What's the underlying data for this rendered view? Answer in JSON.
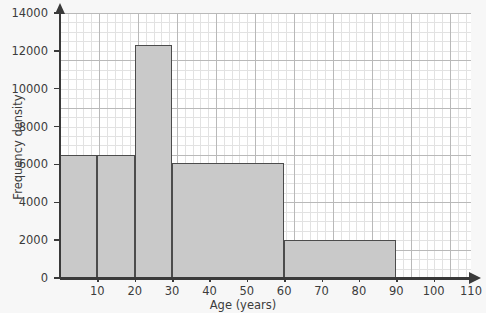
{
  "chart_data": {
    "type": "bar",
    "title": "",
    "subtitle": "",
    "xlabel": "Age (years)",
    "ylabel": "Frequency density",
    "xlim": [
      0,
      110
    ],
    "ylim": [
      0,
      14000
    ],
    "grid": true,
    "legend": null,
    "xticks": [
      "10",
      "20",
      "30",
      "40",
      "50",
      "60",
      "70",
      "80",
      "90",
      "100",
      "110"
    ],
    "xtick_values": [
      10,
      20,
      30,
      40,
      50,
      60,
      70,
      80,
      90,
      100,
      110
    ],
    "yticks": [
      "0",
      "2000",
      "4000",
      "6000",
      "8000",
      "10000",
      "12000",
      "14000"
    ],
    "ytick_values": [
      0,
      2000,
      4000,
      6000,
      8000,
      10000,
      12000,
      14000
    ],
    "bins": [
      {
        "label": "0-10",
        "x_start": 0,
        "x_end": 10,
        "value": 6500
      },
      {
        "label": "10-20",
        "x_start": 10,
        "x_end": 20,
        "value": 6500
      },
      {
        "label": "20-30",
        "x_start": 20,
        "x_end": 30,
        "value": 12300
      },
      {
        "label": "30-60",
        "x_start": 30,
        "x_end": 60,
        "value": 6100
      },
      {
        "label": "60-90",
        "x_start": 60,
        "x_end": 90,
        "value": 2000
      }
    ],
    "categories": [
      "0-10",
      "10-20",
      "20-30",
      "30-60",
      "60-90"
    ],
    "values": [
      6500,
      6500,
      12300,
      6100,
      2000
    ],
    "colors": {
      "bar_fill": "#c9c9c9",
      "bar_border": "#4c4c4c",
      "axis": "#3a3a3a",
      "grid_major": "#b9b9b9",
      "grid_minor": "#e2e2e2",
      "plot_background": "#ffffff",
      "page_background": "#f7f7f7",
      "text": "#3c3c3c"
    }
  }
}
